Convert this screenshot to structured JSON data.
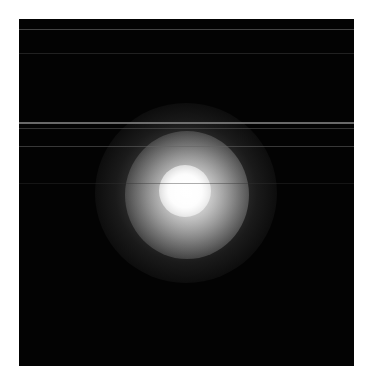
{
  "image": {
    "description": "Diffuse bright glowing spot on black background with faint horizontal streak lines",
    "background_color": "#030303",
    "page_color": "#ffffff",
    "frame": {
      "left": 19,
      "top": 19,
      "width": 335,
      "height": 347
    },
    "glow_center": {
      "x": 185,
      "y": 190
    },
    "streaks": [
      {
        "y": 10,
        "height": 1,
        "color": "rgba(120,120,120,0.55)"
      },
      {
        "y": 34,
        "height": 1,
        "color": "rgba(70,70,70,0.45)"
      },
      {
        "y": 103,
        "height": 2,
        "color": "rgba(140,140,140,0.75)"
      },
      {
        "y": 109,
        "height": 1,
        "color": "rgba(90,90,90,0.55)"
      },
      {
        "y": 127,
        "height": 1,
        "color": "rgba(100,100,100,0.55)"
      },
      {
        "y": 164,
        "height": 1,
        "color": "rgba(50,50,50,0.4)"
      }
    ]
  }
}
